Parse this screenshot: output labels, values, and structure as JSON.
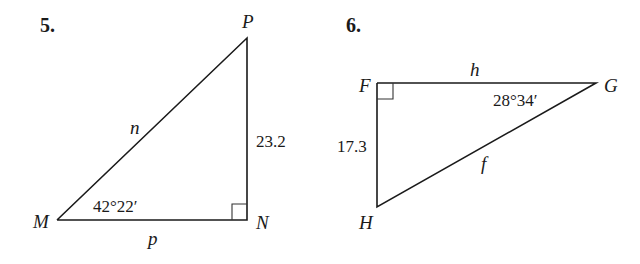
{
  "problems": [
    {
      "number": "5.",
      "vertices": {
        "M": "M",
        "N": "N",
        "P": "P"
      },
      "sides": {
        "hypotenuse": "n",
        "base": "p",
        "vertical": "23.2"
      },
      "angle": {
        "vertex": "M",
        "value": "42°22′"
      },
      "right_angle_at": "N"
    },
    {
      "number": "6.",
      "vertices": {
        "F": "F",
        "G": "G",
        "H": "H"
      },
      "sides": {
        "top": "h",
        "hypotenuse": "f",
        "vertical": "17.3"
      },
      "angle": {
        "vertex": "G",
        "value": "28°34′"
      },
      "right_angle_at": "F"
    }
  ]
}
